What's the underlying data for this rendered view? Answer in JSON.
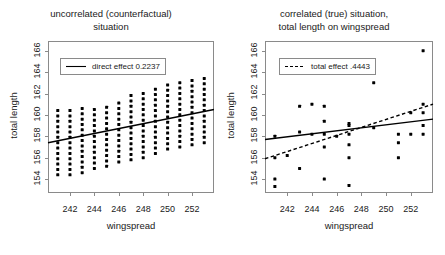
{
  "figure": {
    "width": 445,
    "height": 255,
    "background": "#ffffff",
    "foreground": "#000000"
  },
  "panels": [
    {
      "id": "left",
      "title_line1": "uncorrelated (counterfactual)",
      "title_line2": "situation",
      "legend_label": "direct effect 0.2237",
      "legend_style": "solid",
      "xlabel": "wingspread",
      "ylabel": "total length"
    },
    {
      "id": "right",
      "title_line1": "correlated (true) situation,",
      "title_line2": "total length on wingspread",
      "legend_label": "total effect .4443",
      "legend_style": "dashed",
      "xlabel": "wingspread",
      "ylabel": "total length"
    }
  ],
  "chart_data": [
    {
      "type": "scatter",
      "id": "left-panel",
      "title": "uncorrelated (counterfactual) situation",
      "xlabel": "wingspread",
      "ylabel": "total length",
      "xlim": [
        240.2,
        253.8
      ],
      "ylim": [
        152.7,
        166.9
      ],
      "xticks": [
        242,
        244,
        246,
        248,
        250,
        252
      ],
      "yticks": [
        154,
        156,
        158,
        160,
        162,
        164,
        166
      ],
      "grid": false,
      "legend_position": "upper-left",
      "legend": [
        {
          "name": "direct effect 0.2237",
          "style": "solid",
          "slope": 0.2237
        }
      ],
      "lattice_columns": [
        {
          "x": 241,
          "ymin": 154.4,
          "ymax": 160.4
        },
        {
          "x": 242,
          "ymin": 154.4,
          "ymax": 160.4
        },
        {
          "x": 243,
          "ymin": 154.6,
          "ymax": 160.6
        },
        {
          "x": 244,
          "ymin": 155.0,
          "ymax": 160.8
        },
        {
          "x": 245,
          "ymin": 155.2,
          "ymax": 161.0
        },
        {
          "x": 246,
          "ymin": 155.6,
          "ymax": 161.4
        },
        {
          "x": 247,
          "ymin": 155.8,
          "ymax": 161.8
        },
        {
          "x": 248,
          "ymin": 156.0,
          "ymax": 162.2
        },
        {
          "x": 249,
          "ymin": 156.4,
          "ymax": 162.4
        },
        {
          "x": 250,
          "ymin": 156.8,
          "ymax": 162.8
        },
        {
          "x": 251,
          "ymin": 157.0,
          "ymax": 163.0
        },
        {
          "x": 252,
          "ymin": 157.2,
          "ymax": 163.2
        },
        {
          "x": 253,
          "ymin": 157.4,
          "ymax": 163.6
        }
      ],
      "lattice_step": 0.5,
      "fit_line": {
        "x1": 240.2,
        "y1": 157.4,
        "x2": 253.8,
        "y2": 160.5,
        "style": "solid"
      }
    },
    {
      "type": "scatter",
      "id": "right-panel",
      "title": "correlated (true) situation, total length on wingspread",
      "xlabel": "wingspread",
      "ylabel": "total length",
      "xlim": [
        240.2,
        253.8
      ],
      "ylim": [
        152.7,
        166.9
      ],
      "xticks": [
        242,
        244,
        246,
        248,
        250,
        252
      ],
      "yticks": [
        154,
        156,
        158,
        160,
        162,
        164,
        166
      ],
      "grid": false,
      "legend_position": "upper-left",
      "legend": [
        {
          "name": "total effect .4443",
          "style": "dashed",
          "slope": 0.4443
        }
      ],
      "points": [
        {
          "x": 241,
          "y": 154.0
        },
        {
          "x": 241,
          "y": 153.3
        },
        {
          "x": 241,
          "y": 158.0
        },
        {
          "x": 241,
          "y": 156.0
        },
        {
          "x": 242,
          "y": 156.2
        },
        {
          "x": 243,
          "y": 155.0
        },
        {
          "x": 243,
          "y": 160.8
        },
        {
          "x": 243,
          "y": 158.4
        },
        {
          "x": 244,
          "y": 158.2
        },
        {
          "x": 244,
          "y": 161.0
        },
        {
          "x": 245,
          "y": 154.0
        },
        {
          "x": 245,
          "y": 157.0
        },
        {
          "x": 245,
          "y": 158.2
        },
        {
          "x": 245,
          "y": 160.8
        },
        {
          "x": 245,
          "y": 159.4
        },
        {
          "x": 246,
          "y": 158.0
        },
        {
          "x": 247,
          "y": 153.4
        },
        {
          "x": 247,
          "y": 156.0
        },
        {
          "x": 247,
          "y": 158.2
        },
        {
          "x": 247,
          "y": 157.2
        },
        {
          "x": 247,
          "y": 159.0
        },
        {
          "x": 247,
          "y": 159.2
        },
        {
          "x": 249,
          "y": 158.8
        },
        {
          "x": 249,
          "y": 163.0
        },
        {
          "x": 249,
          "y": 165.0
        },
        {
          "x": 251,
          "y": 156.0
        },
        {
          "x": 251,
          "y": 157.4
        },
        {
          "x": 251,
          "y": 158.2
        },
        {
          "x": 252,
          "y": 158.2
        },
        {
          "x": 252,
          "y": 160.2
        },
        {
          "x": 253,
          "y": 158.2
        },
        {
          "x": 253,
          "y": 159.0
        },
        {
          "x": 253,
          "y": 160.2
        },
        {
          "x": 253,
          "y": 161.0
        },
        {
          "x": 253,
          "y": 166.0
        }
      ],
      "fit_line_solid": {
        "x1": 240.2,
        "y1": 157.7,
        "x2": 253.8,
        "y2": 159.6,
        "style": "solid"
      },
      "fit_line_dashed": {
        "x1": 240.2,
        "y1": 155.9,
        "x2": 253.8,
        "y2": 161.0,
        "style": "dashed"
      }
    }
  ]
}
